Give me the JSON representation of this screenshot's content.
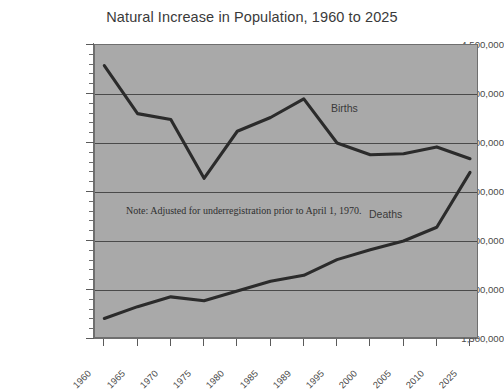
{
  "chart_data": {
    "type": "line",
    "title": "Natural Increase in Population, 1960 to 2025",
    "xlabel": "",
    "ylabel": "",
    "categories": [
      "1960",
      "1965",
      "1970",
      "1975",
      "1980",
      "1985",
      "1989",
      "1995",
      "2000",
      "2005",
      "2010",
      "2025"
    ],
    "series": [
      {
        "name": "Births",
        "values": [
          4290000,
          3800000,
          3740000,
          3140000,
          3620000,
          3760000,
          3950000,
          3500000,
          3380000,
          3390000,
          3460000,
          3340000
        ]
      },
      {
        "name": "Deaths",
        "values": [
          1710000,
          1830000,
          1930000,
          1890000,
          1990000,
          2090000,
          2150000,
          2310000,
          2410000,
          2500000,
          2640000,
          3200000
        ]
      }
    ],
    "ylim": [
      1500000,
      4500000
    ],
    "ytick_values": [
      1500000,
      2000000,
      2500000,
      3000000,
      3500000,
      4000000,
      4500000
    ],
    "ytick_labels": [
      "1,500,000",
      "2,000,000",
      "2,500,000",
      "3,000,000",
      "3,500,000",
      "4,000,000",
      "4,500,000"
    ],
    "yminor_step": 100000,
    "grid": true,
    "legend": "inline-series-labels",
    "plot_background_color": "#a9a9a9",
    "series_color": "#2b2b2b",
    "gridline_color": "#4a4a4a",
    "annotations": [
      {
        "name": "underregistration-note",
        "text": "Note: Adjusted for underregistration prior to April 1, 1970."
      }
    ],
    "series_inline_labels": [
      {
        "name": "Births",
        "text": "Births"
      },
      {
        "name": "Deaths",
        "text": "Deaths"
      }
    ]
  }
}
